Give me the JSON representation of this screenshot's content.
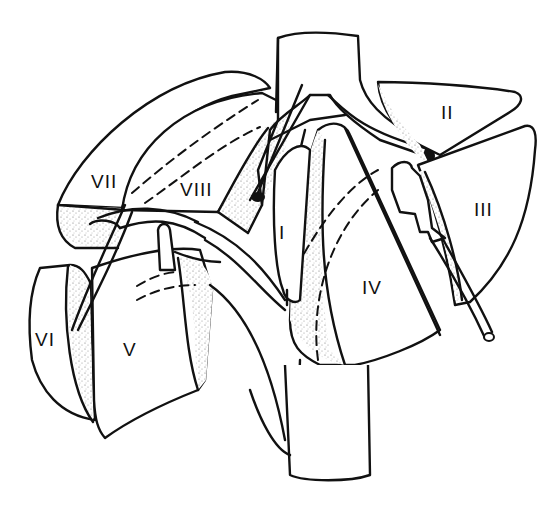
{
  "figure": {
    "segments": [
      {
        "id": "I",
        "label": "I",
        "x": 279,
        "y": 232
      },
      {
        "id": "II",
        "label": "II",
        "x": 441,
        "y": 104
      },
      {
        "id": "III",
        "label": "III",
        "x": 474,
        "y": 200
      },
      {
        "id": "IV",
        "label": "IV",
        "x": 361,
        "y": 278
      },
      {
        "id": "V",
        "label": "V",
        "x": 123,
        "y": 342
      },
      {
        "id": "VI",
        "label": "VI",
        "x": 35,
        "y": 332
      },
      {
        "id": "VII",
        "label": "VII",
        "x": 91,
        "y": 172
      },
      {
        "id": "VIII",
        "label": "VIII",
        "x": 180,
        "y": 180
      }
    ],
    "colors": {
      "line": "#111111",
      "background": "#ffffff",
      "stipple": "#9a9a9a"
    }
  }
}
